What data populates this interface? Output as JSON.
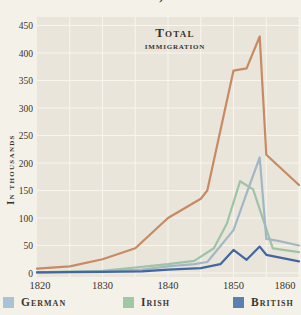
{
  "header": {
    "title_clipped": "United States, 1820–1860"
  },
  "colors": {
    "page_bg": "#f4f1e9",
    "plot_bg": "#e9e5da",
    "grid": "#f7f5ee",
    "text": "#38332b"
  },
  "chart_data": {
    "type": "line",
    "title": "United States, 1820–1860",
    "annotation": {
      "line1": "Total",
      "line2": "immigration"
    },
    "ylabel": "In thousands",
    "xlim": [
      1820,
      1860
    ],
    "ylim": [
      0,
      450
    ],
    "x_ticks": [
      1820,
      1830,
      1840,
      1850,
      1860
    ],
    "y_ticks": [
      0,
      50,
      100,
      150,
      200,
      250,
      300,
      350,
      400,
      450
    ],
    "grid": true,
    "legend_position": "bottom",
    "series": [
      {
        "name": "Irish",
        "color": "#9dc4a4",
        "points": [
          [
            1820,
            1
          ],
          [
            1830,
            4
          ],
          [
            1835,
            10
          ],
          [
            1840,
            16
          ],
          [
            1844,
            22
          ],
          [
            1847,
            45
          ],
          [
            1849,
            90
          ],
          [
            1851,
            167
          ],
          [
            1853,
            152
          ],
          [
            1856,
            45
          ],
          [
            1860,
            38
          ]
        ]
      },
      {
        "name": "German",
        "color": "#a2b7c6",
        "points": [
          [
            1820,
            1
          ],
          [
            1830,
            3
          ],
          [
            1836,
            6
          ],
          [
            1840,
            12
          ],
          [
            1844,
            16
          ],
          [
            1846,
            20
          ],
          [
            1850,
            78
          ],
          [
            1852,
            145
          ],
          [
            1854,
            210
          ],
          [
            1855,
            62
          ],
          [
            1857,
            58
          ],
          [
            1860,
            50
          ]
        ]
      },
      {
        "name": "British",
        "color": "#41679e",
        "points": [
          [
            1820,
            1
          ],
          [
            1830,
            2
          ],
          [
            1836,
            3
          ],
          [
            1840,
            6
          ],
          [
            1845,
            9
          ],
          [
            1848,
            16
          ],
          [
            1850,
            42
          ],
          [
            1852,
            24
          ],
          [
            1854,
            48
          ],
          [
            1855,
            33
          ],
          [
            1860,
            21
          ]
        ]
      },
      {
        "name": "Total immigration",
        "color": "#c88a62",
        "points": [
          [
            1820,
            8
          ],
          [
            1825,
            12
          ],
          [
            1830,
            25
          ],
          [
            1835,
            45
          ],
          [
            1840,
            100
          ],
          [
            1845,
            135
          ],
          [
            1846,
            150
          ],
          [
            1850,
            368
          ],
          [
            1852,
            372
          ],
          [
            1854,
            430
          ],
          [
            1855,
            215
          ],
          [
            1860,
            160
          ]
        ]
      }
    ]
  },
  "legend": {
    "items": [
      {
        "label": "German",
        "color": "#a9c2d6"
      },
      {
        "label": "Irish",
        "color": "#9ec9a4"
      },
      {
        "label": "British",
        "color": "#5a7fb3"
      }
    ]
  }
}
